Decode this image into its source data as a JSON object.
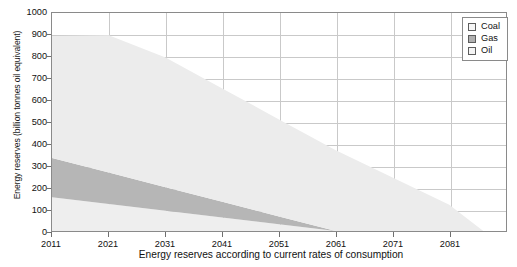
{
  "chart_data": {
    "type": "area",
    "title": "",
    "subtitle": "",
    "caption": "Energy reserves according to current rates of consumption",
    "xlabel": "",
    "ylabel": "Energy reserves (billion tonnes oil equivalent)",
    "stacked": true,
    "grid": true,
    "legend_position": "top-right",
    "xlim": [
      2011,
      2091
    ],
    "ylim": [
      0,
      1000
    ],
    "ytick_step": 100,
    "yticks": [
      0,
      100,
      200,
      300,
      400,
      500,
      600,
      700,
      800,
      900,
      1000
    ],
    "xticks": [
      2011,
      2021,
      2031,
      2041,
      2051,
      2061,
      2071,
      2081
    ],
    "x": [
      2011,
      2021,
      2031,
      2041,
      2051,
      2061,
      2071,
      2081,
      2087
    ],
    "series": [
      {
        "name": "Oil",
        "color": "#eeeeee",
        "legend_swatch": "#f4f4f4",
        "depletion_year": 2061,
        "values": [
          155,
          124,
          93,
          62,
          31,
          0,
          0,
          0,
          0
        ]
      },
      {
        "name": "Gas",
        "color": "#b6b6b6",
        "legend_swatch": "#b0b0b0",
        "depletion_year": 2061,
        "values": [
          180,
          144,
          108,
          72,
          36,
          0,
          0,
          0,
          0
        ]
      },
      {
        "name": "Coal",
        "color": "#ececec",
        "legend_swatch": "#f6f6f6",
        "depletion_year": 2087,
        "values": [
          560,
          630,
          595,
          520,
          445,
          370,
          245,
          120,
          0
        ]
      }
    ],
    "stack_tops": {
      "2011": {
        "oil": 155,
        "gas": 335,
        "coal": 895
      },
      "2061": {
        "oil": 0,
        "gas": 0,
        "coal": 370
      },
      "2087": {
        "oil": 0,
        "gas": 0,
        "coal": 0
      }
    },
    "legend_entries": [
      {
        "label": "Coal",
        "swatch": "#f6f6f6"
      },
      {
        "label": "Gas",
        "swatch": "#b0b0b0"
      },
      {
        "label": "Oil",
        "swatch": "#f4f4f4"
      }
    ],
    "ghost_text": [
      "into water move th",
      "th it rain. They coll",
      "els of watr"
    ]
  },
  "colors": {
    "frame": "#8a8a8a",
    "grid": "#c9c9c9",
    "text": "#111111",
    "background": "#ffffff"
  }
}
